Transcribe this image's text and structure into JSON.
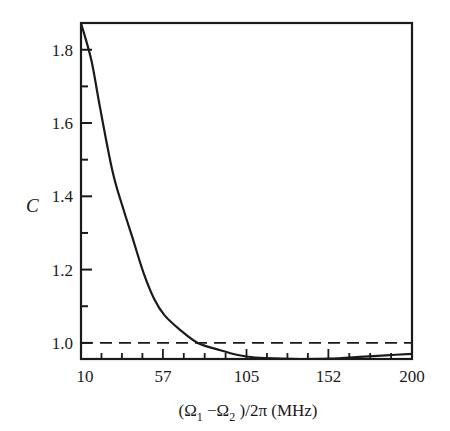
{
  "chart_data": {
    "type": "line",
    "title": "",
    "xlabel": "(Ω1 − Ω2)/2π (MHz)",
    "xlabel_parts": {
      "open": "(Ω",
      "sub1": "1",
      "minus": " −Ω",
      "sub2": "2",
      "close": " )/2π (MHz)"
    },
    "ylabel": "C",
    "xlim": [
      10,
      200
    ],
    "ylim": [
      0.956,
      1.873
    ],
    "x_ticks": [
      10,
      57,
      105,
      152,
      200
    ],
    "x_tick_labels": [
      "10",
      "57",
      "105",
      "152",
      "200"
    ],
    "y_ticks": [
      1.0,
      1.2,
      1.4,
      1.6,
      1.8
    ],
    "y_tick_labels": [
      "1.0",
      "1.2",
      "1.4",
      "1.6",
      "1.8"
    ],
    "grid": false,
    "legend": null,
    "series": [
      {
        "name": "C",
        "style": "solid",
        "x": [
          10,
          16,
          21,
          28,
          34,
          40,
          46,
          52,
          58,
          67,
          77,
          90,
          100,
          110,
          125,
          136,
          152,
          170,
          185,
          200
        ],
        "values": [
          1.873,
          1.77,
          1.64,
          1.47,
          1.37,
          1.28,
          1.19,
          1.12,
          1.075,
          1.035,
          1.0,
          0.98,
          0.967,
          0.96,
          0.957,
          0.956,
          0.957,
          0.962,
          0.966,
          0.97
        ]
      },
      {
        "name": "C = 1 reference",
        "style": "dashed",
        "x": [
          10,
          200
        ],
        "values": [
          1.0,
          1.0
        ]
      }
    ]
  },
  "colors": {
    "ink": "#1a1a1a",
    "background": "#ffffff"
  }
}
